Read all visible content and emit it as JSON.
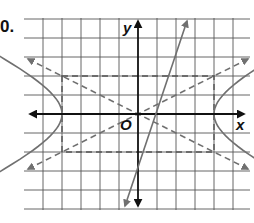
{
  "exercise_label": "0.",
  "axes": {
    "x_label": "x",
    "y_label": "y",
    "origin_label": "O"
  },
  "grid": {
    "unit_px": 19,
    "origin_px": [
      138,
      114
    ],
    "x_range": [
      -6,
      6
    ],
    "y_range": [
      -5,
      5
    ]
  },
  "figures": {
    "hyperbola": {
      "equation": "x^2/16 - y^2/4 = 1",
      "a": 4,
      "b": 2,
      "color": "#707070"
    },
    "asymptotes": [
      {
        "equation": "y = x/2"
      },
      {
        "equation": "y = -x/2"
      }
    ],
    "rectangle": {
      "x": [
        -4,
        4
      ],
      "y": [
        -2,
        2
      ],
      "style": "dashed"
    },
    "line": {
      "equation": "y = 3x - 2",
      "color": "#707070"
    }
  },
  "colors": {
    "axis": "#111111",
    "grid": "#444444",
    "curve": "#707070"
  }
}
